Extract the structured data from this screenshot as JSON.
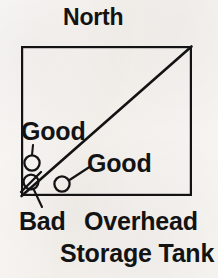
{
  "figure": {
    "title": "North",
    "caption_line_1": "Overhead",
    "caption_line_2": "Storage Tank",
    "ink_color": "#131313",
    "paper_color": "#f6f4f1"
  },
  "boundary": {
    "name": "site-boundary-square",
    "x": 21,
    "y": 46,
    "width": 171,
    "height": 150,
    "stroke_width": 2.2
  },
  "diagonal": {
    "name": "diagonal-line",
    "x1": 21,
    "y1": 196,
    "x2": 192,
    "y2": 46,
    "stroke_width": 2.6
  },
  "markers": [
    {
      "id": "good-well-1",
      "status": "Good",
      "symbol": "open-circle",
      "cx": 32,
      "cy": 163,
      "r": 8,
      "leader": {
        "x1": 33,
        "y1": 145,
        "x2": 32,
        "y2": 155
      },
      "label": "Good",
      "label_x": 21,
      "label_y": 119
    },
    {
      "id": "good-well-2",
      "status": "Good",
      "symbol": "open-circle",
      "cx": 62,
      "cy": 184,
      "r": 8,
      "leader": {
        "x1": 69,
        "y1": 179,
        "x2": 90,
        "y2": 166
      },
      "label": "Good",
      "label_x": 87,
      "label_y": 151
    },
    {
      "id": "bad-well",
      "status": "Bad",
      "symbol": "slashed-circle",
      "cx": 31,
      "cy": 182,
      "r": 8,
      "leader": {
        "x1": 34,
        "y1": 190,
        "x2": 42,
        "y2": 208
      },
      "label": "Bad",
      "label_x": 19,
      "label_y": 209
    }
  ],
  "legend_text": {
    "good": "Good",
    "bad": "Bad"
  }
}
